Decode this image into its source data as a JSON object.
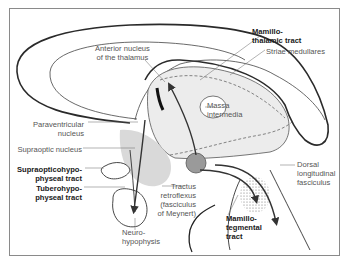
{
  "figure": {
    "labels": {
      "mamillothalamic_tract": [
        "Mamillo-",
        "thalamic tract"
      ],
      "anterior_nucleus": [
        "Anterior nucleus",
        "of the thalamus"
      ],
      "striae_medullares": "Striae medullares",
      "massa_intermedia": [
        "Massa",
        "intermedia"
      ],
      "paraventricular_nucleus": [
        "Paraventricular",
        "nucleus"
      ],
      "supraoptic_nucleus": "Supraoptic nucleus",
      "supraopticohypophyseal_tract": [
        "Supraopticohypo-",
        "physeal tract"
      ],
      "tuberohypophyseal_tract": [
        "Tuberohypo-",
        "physeal tract"
      ],
      "tractus_retroflexus": [
        "Tractus",
        "retroflexus",
        "(fasciculus",
        "of Meynert)"
      ],
      "neurohypophysis": [
        "Neuro-",
        "hypophysis"
      ],
      "mamillotegmental_tract": [
        "Mamillo-",
        "tegmental",
        "tract"
      ],
      "dorsal_longitudinal_fasciculus": [
        "Dorsal",
        "longitudinal",
        "fasciculus"
      ]
    },
    "colors": {
      "outline": "#2a2a2a",
      "tract_arrow": "#3a3a3a",
      "shading": "#d9d9d9",
      "nucleus_fill": "#9a9a9a",
      "label_regular": "#555555",
      "label_bold": "#1a1a1a"
    }
  }
}
